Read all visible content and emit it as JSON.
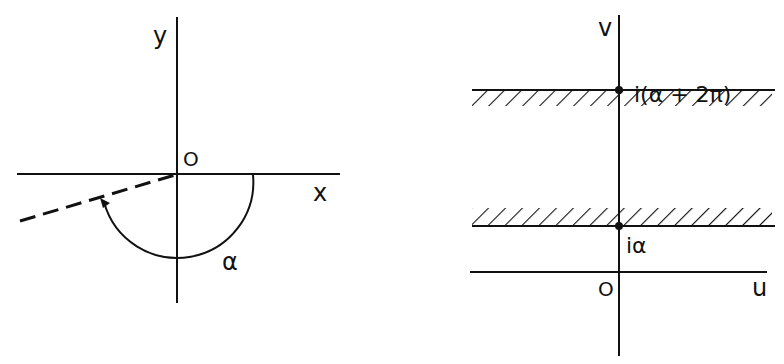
{
  "left_diagram": {
    "plane": "z-plane",
    "axis_x_label": "x",
    "axis_y_label": "y",
    "origin_label": "O",
    "angle_label": "α",
    "elements": [
      "x-axis",
      "y-axis",
      "dashed-ray",
      "angle-arc-with-arrow"
    ]
  },
  "right_diagram": {
    "plane": "w-plane",
    "axis_u_label": "u",
    "axis_v_label": "v",
    "origin_label": "O",
    "upper_point_label": "i(α + 2π)",
    "lower_point_label": "iα",
    "elements": [
      "u-axis",
      "v-axis",
      "upper-boundary-line-hatched-below",
      "lower-boundary-line-hatched-above",
      "point-i-alpha",
      "point-i-alpha-plus-2pi"
    ]
  },
  "colors": {
    "ink": "#111111",
    "background": "#ffffff"
  }
}
